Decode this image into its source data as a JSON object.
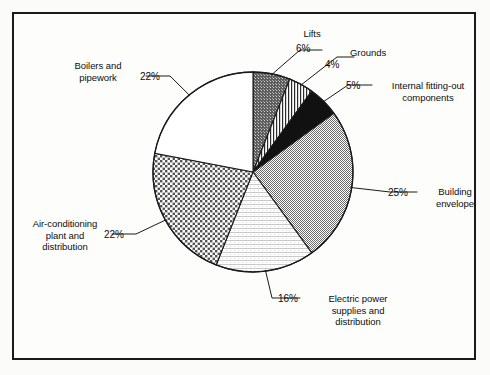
{
  "chart_data": {
    "type": "pie",
    "title": "",
    "subtitle": "",
    "xlabel": "",
    "ylabel": "",
    "legend_position": "none",
    "grid": false,
    "units": "percent",
    "total": 100,
    "start_angle_deg": 0,
    "direction": "clockwise",
    "categories": [
      "Lifts",
      "Grounds",
      "Internal fitting-out components",
      "Building envelope",
      "Electric power supplies and distribution",
      "Air-conditioning plant and distribution",
      "Boilers and pipework"
    ],
    "values": [
      6,
      4,
      5,
      25,
      16,
      22,
      22
    ],
    "slices": [
      {
        "name": "Lifts",
        "label": "Lifts",
        "value": 6,
        "value_label": "6%",
        "fill": "dark-dotted-gray",
        "fill_color": "#6e6e6e",
        "start_deg": 0,
        "end_deg": 21.6
      },
      {
        "name": "Grounds",
        "label": "Grounds",
        "value": 4,
        "value_label": "4%",
        "fill": "vertical-stripes",
        "fill_color": "#ffffff",
        "start_deg": 21.6,
        "end_deg": 36.0
      },
      {
        "name": "Internal fitting-out components",
        "label": "Internal fitting-out\ncomponents",
        "value": 5,
        "value_label": "5%",
        "fill": "solid-black",
        "fill_color": "#111111",
        "start_deg": 36.0,
        "end_deg": 54.0
      },
      {
        "name": "Building envelope",
        "label": "Building\nenvelope",
        "value": 25,
        "value_label": "25%",
        "fill": "medium-gray-checker",
        "fill_color": "#9a9a9a",
        "start_deg": 54.0,
        "end_deg": 144.0
      },
      {
        "name": "Electric power supplies and distribution",
        "label": "Electric power\nsupplies and\ndistribution",
        "value": 16,
        "value_label": "16%",
        "fill": "light-horizontal-lines",
        "fill_color": "#ededed",
        "start_deg": 144.0,
        "end_deg": 201.6
      },
      {
        "name": "Air-conditioning plant and distribution",
        "label": "Air-conditioning\nplant and\ndistribution",
        "value": 22,
        "value_label": "22%",
        "fill": "coarse-checkerboard",
        "fill_color": "#8c8c8c",
        "start_deg": 201.6,
        "end_deg": 280.8
      },
      {
        "name": "Boilers and pipework",
        "label": "Boilers and\npipework",
        "value": 22,
        "value_label": "22%",
        "fill": "white",
        "fill_color": "#ffffff",
        "start_deg": 280.8,
        "end_deg": 360.0
      }
    ]
  },
  "figure": {
    "frame_color": "#1a1a1a",
    "background_color": "#fdfdfc",
    "outline_color": "#1a1a1a"
  }
}
